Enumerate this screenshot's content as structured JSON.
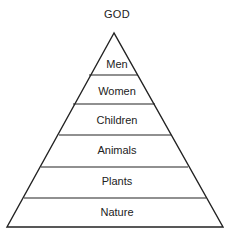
{
  "diagram": {
    "type": "pyramid",
    "apex_label": "GOD",
    "tiers": [
      {
        "label": "Men"
      },
      {
        "label": "Women"
      },
      {
        "label": "Children"
      },
      {
        "label": "Animals"
      },
      {
        "label": "Plants"
      },
      {
        "label": "Nature"
      }
    ],
    "line_color": "#222222"
  }
}
